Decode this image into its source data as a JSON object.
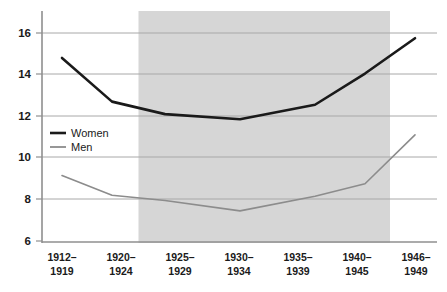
{
  "chart_data": {
    "type": "line",
    "title": "",
    "subtitle": "",
    "xlabel": "",
    "ylabel": "",
    "categories": [
      "1912–\n1919",
      "1920–\n1924",
      "1925–\n1929",
      "1930–\n1934",
      "1935–\n1939",
      "1940–\n1945",
      "1946–\n1949"
    ],
    "category_lines": [
      [
        "1912–",
        "1919"
      ],
      [
        "1920–",
        "1924"
      ],
      [
        "1925–",
        "1929"
      ],
      [
        "1930–",
        "1934"
      ],
      [
        "1935–",
        "1939"
      ],
      [
        "1940–",
        "1945"
      ],
      [
        "1946–",
        "1949"
      ]
    ],
    "series": [
      {
        "name": "Women",
        "color": "#1a1a1a",
        "line_width": 2.6,
        "values": [
          14.8,
          12.7,
          12.1,
          11.85,
          12.55,
          14.05,
          15.75
        ]
      },
      {
        "name": "Men",
        "color": "#8c8c8c",
        "line_width": 1.6,
        "values": [
          9.15,
          8.2,
          7.95,
          7.45,
          8.15,
          8.75,
          11.1
        ]
      }
    ],
    "ylim": [
      5.55,
      16.65
    ],
    "yticks": [
      16,
      14,
      12,
      10,
      8,
      6
    ],
    "ytick_labels": [
      "16",
      "14",
      "12",
      "10",
      "8",
      "6"
    ],
    "grid": true,
    "grid_color": "#a8a8a8",
    "axis_color": "#8f8f8f",
    "legend_position": "inside-left",
    "shaded_region": {
      "from_category_index": 2,
      "to_category_index": 5,
      "color": "#d6d6d6",
      "label": ""
    },
    "background": "#ffffff"
  },
  "legend": {
    "entries": [
      {
        "label": "Women"
      },
      {
        "label": "Men"
      }
    ]
  },
  "axes": {
    "y_tick_labels": [
      "16",
      "14",
      "12",
      "10",
      "8",
      "6"
    ],
    "x_tick_labels_line1": [
      "1912–",
      "1920–",
      "1925–",
      "1930–",
      "1935–",
      "1940–",
      "1946–"
    ],
    "x_tick_labels_line2": [
      "1919",
      "1924",
      "1929",
      "1934",
      "1939",
      "1945",
      "1949"
    ]
  }
}
